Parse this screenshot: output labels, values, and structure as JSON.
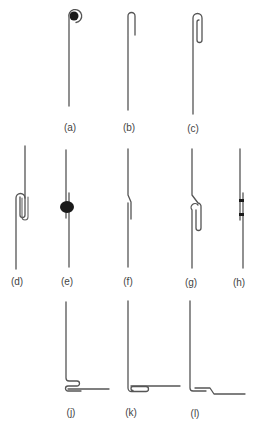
{
  "figure": {
    "background": "#ffffff",
    "line_color": "#555555",
    "blob_color": "#1a1a1a",
    "panels": [
      {
        "id": "a",
        "label": "(a)",
        "description": "wire end rolled into a coil around a solid core"
      },
      {
        "id": "b",
        "label": "(b)",
        "description": "single hook bend at top"
      },
      {
        "id": "c",
        "label": "(c)",
        "description": "long folded loop at top"
      },
      {
        "id": "d",
        "label": "(d)",
        "description": "two wires interlocked in double U-fold"
      },
      {
        "id": "e",
        "label": "(e)",
        "description": "overlapping wires joined by a solid blob"
      },
      {
        "id": "f",
        "label": "(f)",
        "description": "offset lap with joggle"
      },
      {
        "id": "g",
        "label": "(g)",
        "description": "joggled wire with folded loop"
      },
      {
        "id": "h",
        "label": "(h)",
        "description": "lap joint with two small spot welds"
      },
      {
        "id": "j",
        "label": "(j)",
        "description": "corner joint with S-fold at base"
      },
      {
        "id": "k",
        "label": "(k)",
        "description": "corner joint with wrapped fold at base"
      },
      {
        "id": "l",
        "label": "(l)",
        "description": "corner joint with joggled lap at base"
      }
    ]
  }
}
